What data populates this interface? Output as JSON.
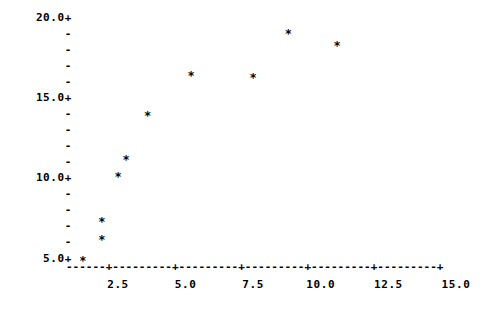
{
  "chart_data": {
    "type": "scatter",
    "title": "",
    "subtitle": "",
    "xlabel": "",
    "ylabel": "",
    "xlim": [
      0.0,
      15.8
    ],
    "ylim": [
      4.6,
      20.3
    ],
    "grid": false,
    "legend": null,
    "marker": "*",
    "axis_style": "ascii-character-plot",
    "y_tick_labels": [
      "20.0+",
      "15.0+",
      "10.0+",
      "5.0+"
    ],
    "y_tick_values": [
      20.0,
      15.0,
      10.0,
      5.0
    ],
    "y_minor_tick_glyph": "-",
    "y_minor_ticks_between_majors": 4,
    "x_tick_labels": [
      "2.5",
      "5.0",
      "7.5",
      "10.0",
      "12.5",
      "15.0"
    ],
    "x_tick_values": [
      2.5,
      5.0,
      7.5,
      10.0,
      12.5,
      15.0
    ],
    "x_axis_glyphs": "------+---------+---------+---------+---------+---------+",
    "x_major_tick_glyph": "+",
    "x_minor_tick_glyph": "-",
    "points": [
      {
        "label": "p1",
        "x": 1.2,
        "y": 5.0
      },
      {
        "label": "p2",
        "x": 1.9,
        "y": 6.3
      },
      {
        "label": "p3",
        "x": 1.9,
        "y": 7.4
      },
      {
        "label": "p4",
        "x": 2.5,
        "y": 10.2
      },
      {
        "label": "p5",
        "x": 2.8,
        "y": 11.3
      },
      {
        "label": "p6",
        "x": 3.6,
        "y": 14.0
      },
      {
        "label": "p7",
        "x": 5.2,
        "y": 16.5
      },
      {
        "label": "p8",
        "x": 7.5,
        "y": 16.4
      },
      {
        "label": "p9",
        "x": 8.8,
        "y": 19.1
      },
      {
        "label": "p10",
        "x": 10.6,
        "y": 18.4
      }
    ],
    "colors": {
      "background": "#ffffff",
      "foreground": "#000000",
      "marker": "#000000"
    }
  },
  "axes_layout": {
    "y_rows": [
      {
        "text": "20.0+",
        "value": 20.0,
        "major": true
      },
      {
        "text": "-",
        "value": 19.0,
        "major": false
      },
      {
        "text": "-",
        "value": 18.0,
        "major": false
      },
      {
        "text": "-",
        "value": 17.0,
        "major": false
      },
      {
        "text": "-",
        "value": 16.0,
        "major": false
      },
      {
        "text": "15.0+",
        "value": 15.0,
        "major": true
      },
      {
        "text": "-",
        "value": 14.0,
        "major": false
      },
      {
        "text": "-",
        "value": 13.0,
        "major": false
      },
      {
        "text": "-",
        "value": 12.0,
        "major": false
      },
      {
        "text": "-",
        "value": 11.0,
        "major": false
      },
      {
        "text": "10.0+",
        "value": 10.0,
        "major": true
      },
      {
        "text": "-",
        "value": 9.0,
        "major": false
      },
      {
        "text": "-",
        "value": 8.0,
        "major": false
      },
      {
        "text": "-",
        "value": 7.0,
        "major": false
      },
      {
        "text": "-",
        "value": 6.0,
        "major": false
      },
      {
        "text": "5.0+",
        "value": 5.0,
        "major": true
      }
    ]
  }
}
